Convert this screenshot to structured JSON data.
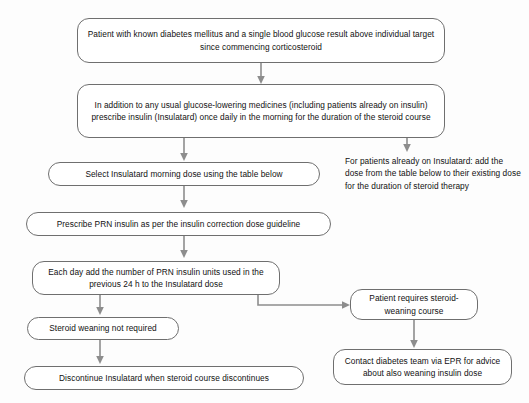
{
  "diagram": {
    "theme": {
      "background": "#fdfdfd",
      "node_border": "#6f6f6f",
      "node_fill": "#ffffff",
      "text": "#111111",
      "connector": "#8d8d8d"
    },
    "nodes": [
      {
        "id": "trigger",
        "text": "Patient with known diabetes mellitus and a single blood glucose result above individual target since commencing corticosteroid"
      },
      {
        "id": "prescribe-insulatard",
        "text": "In addition to any usual glucose-lowering medicines (including patients already on insulin) prescribe insulin (Insulatard) once daily in the morning for the duration of the steroid course"
      },
      {
        "id": "select-dose",
        "text": "Select Insulatard morning dose using the table below"
      },
      {
        "id": "prescribe-prn",
        "text": "Prescribe PRN insulin as per the insulin correction dose guideline"
      },
      {
        "id": "daily-titration",
        "text": "Each day add the number of PRN insulin units used in the previous 24 h to the Insulatard dose"
      },
      {
        "id": "no-weaning",
        "text": "Steroid weaning not required"
      },
      {
        "id": "discontinue",
        "text": "Discontinue Insulatard when steroid course discontinues"
      },
      {
        "id": "weaning-required",
        "text": "Patient requires steroid-weaning course"
      },
      {
        "id": "contact-team",
        "text": "Contact diabetes team via EPR for advice about also weaning insulin dose"
      }
    ],
    "notes": [
      {
        "id": "existing-insulatard",
        "text": "For patients already on Insulatard: add the dose from the table below to their existing dose for the duration of steroid therapy"
      }
    ]
  }
}
